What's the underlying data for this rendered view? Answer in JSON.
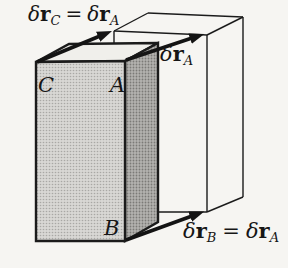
{
  "figure": {
    "background": "#f6f5f2"
  },
  "colors": {
    "line": "#1b1b1b",
    "text": "#161616",
    "front_face": "#d8d7d4",
    "front_dot": "#a9a8a5",
    "side_face": "#b3b2af",
    "side_dot": "#7b7a77",
    "top_face": "#f0efeb",
    "arrow": "#141414"
  },
  "vertex_labels": {
    "C": "C",
    "A": "A",
    "B": "B"
  },
  "displacement_labels": {
    "top_left": {
      "delta1": "δ",
      "r1": "r",
      "sub1": "C",
      "eq": "=",
      "delta2": "δ",
      "r2": "r",
      "sub2": "A"
    },
    "right": {
      "delta": "δ",
      "r": "r",
      "sub": "A"
    },
    "bottom_right": {
      "delta1": "δ",
      "r1": "r",
      "sub1": "B",
      "eq": "=",
      "delta2": "δ",
      "r2": "r",
      "sub2": "A"
    }
  }
}
